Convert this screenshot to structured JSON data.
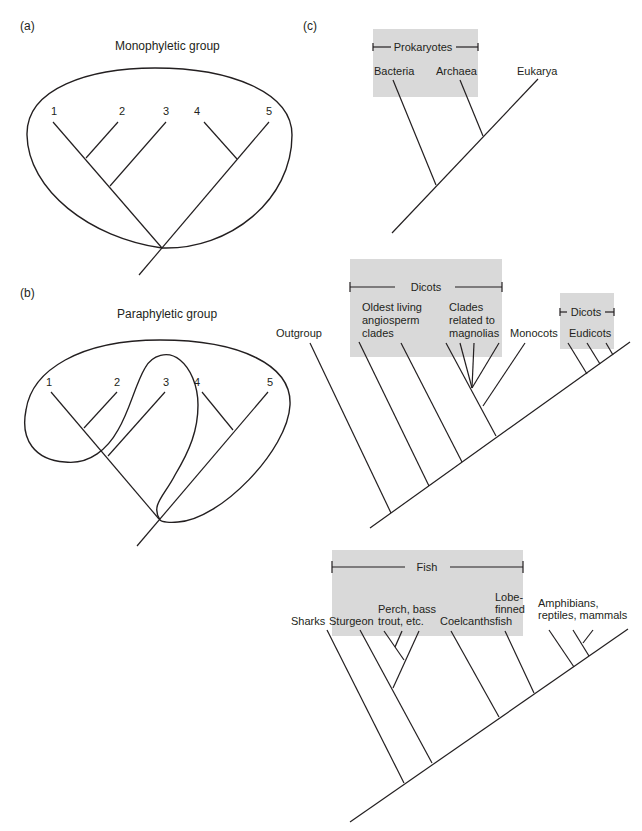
{
  "panels": {
    "a": {
      "letter": "(a)",
      "title": "Monophyletic group",
      "taxa": [
        "1",
        "2",
        "3",
        "4",
        "5"
      ]
    },
    "b": {
      "letter": "(b)",
      "title": "Paraphyletic group",
      "taxa": [
        "1",
        "2",
        "3",
        "4",
        "5"
      ]
    },
    "c": {
      "letter": "(c)",
      "tree1": {
        "bracket": "Prokaryotes",
        "taxa": [
          "Bacteria",
          "Archaea",
          "Eukarya"
        ]
      },
      "tree2": {
        "bracket_main": "Dicots",
        "bracket_small": "Dicots",
        "outgroup": "Outgroup",
        "oldest": [
          "Oldest living",
          "angiosperm",
          "clades"
        ],
        "magnolias": [
          "Clades",
          "related to",
          "magnolias"
        ],
        "monocots": "Monocots",
        "eudicots": "Eudicots"
      },
      "tree3": {
        "bracket": "Fish",
        "sharks": "Sharks",
        "sturgeon": "Sturgeon",
        "perch": [
          "Perch, bass",
          "trout, etc."
        ],
        "coelacanths": "Coelcanths",
        "lobe": [
          "Lobe-",
          "finned",
          "fish"
        ],
        "tetrapods": [
          "Amphibians,",
          "reptiles, mammals"
        ]
      }
    }
  },
  "colors": {
    "line": "#231f20",
    "highlight_box": "#d9d9d9"
  }
}
